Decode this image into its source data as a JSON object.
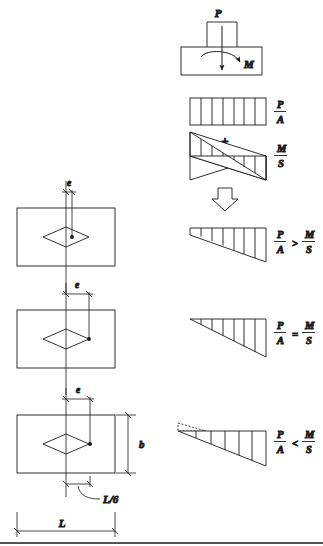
{
  "figure": {
    "stroke_color": "#1a1a1a",
    "background": "#ffffff"
  },
  "top_diagram": {
    "name": "column-on-footing-with-loads",
    "load_label": "P",
    "moment_label": "M",
    "arrow_down_name": "axial-load-arrow",
    "arrow_moment_name": "moment-arrow"
  },
  "stress_blocks": [
    {
      "id": "uniform",
      "shape": "rectangle",
      "divisions": 6,
      "label_numerator": "P",
      "label_denominator": "A",
      "comparison": ""
    },
    {
      "id": "bending",
      "shape": "linear-antisymmetric",
      "divisions": 6,
      "label_numerator": "M",
      "label_denominator": "S",
      "comparison": ""
    },
    {
      "id": "combined-case-1",
      "shape": "trapezoid",
      "divisions": 7,
      "label_numerator": "P",
      "label_denominator": "A",
      "comparison": ">",
      "label_numerator_2": "M",
      "label_denominator_2": "S"
    },
    {
      "id": "combined-case-2",
      "shape": "triangle-full",
      "divisions": 6,
      "label_numerator": "P",
      "label_denominator": "A",
      "comparison": "=",
      "label_numerator_2": "M",
      "label_denominator_2": "S"
    },
    {
      "id": "combined-case-3",
      "shape": "triangle-partial-with-uplift",
      "divisions": 6,
      "label_numerator": "P",
      "label_denominator": "A",
      "comparison": "<",
      "label_numerator_2": "M",
      "label_denominator_2": "S"
    }
  ],
  "operators": {
    "plus": "+",
    "arrow_down": "block-arrow-down"
  },
  "plans": [
    {
      "id": "plan-1",
      "ecc_label": "e",
      "note": "load inside kern",
      "load_point_x_offset": 6
    },
    {
      "id": "plan-2",
      "ecc_label": "e",
      "note": "load at kern boundary",
      "load_point_x_offset": 17
    },
    {
      "id": "plan-3",
      "ecc_label": "e",
      "note": "load outside kern",
      "load_point_x_offset": 24,
      "dim_b": "b",
      "dim_L": "L",
      "dim_kern": "L/6"
    }
  ],
  "dimension_labels": {
    "width": "L",
    "depth": "b",
    "kern": "L/6",
    "eccentricity": "e"
  }
}
